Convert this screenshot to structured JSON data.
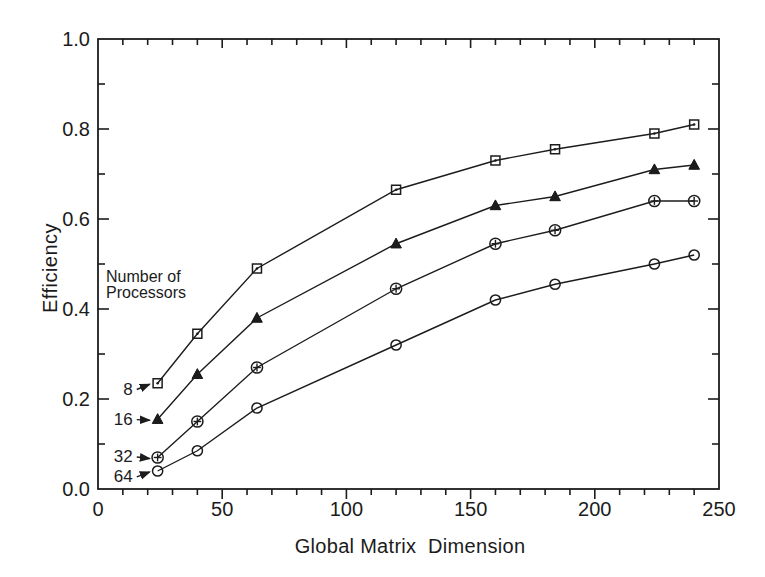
{
  "figure": {
    "y_axis_label": "Efficiency",
    "x_axis_label": "Global Matrix  Dimension",
    "legend_title_line1": "Number of",
    "legend_title_line2": "Processors"
  },
  "colors": {
    "ink": "#1c1c1c",
    "text": "#1b1b1b",
    "paper": "#ffffff"
  },
  "chart_data": {
    "type": "line",
    "title": "",
    "xlabel": "Global Matrix  Dimension",
    "ylabel": "Efficiency",
    "xlim": [
      0,
      250
    ],
    "ylim": [
      0.0,
      1.0
    ],
    "x_major_ticks": [
      0,
      50,
      100,
      150,
      200,
      250
    ],
    "x_minor_tick_step": 10,
    "y_major_ticks": [
      0.0,
      0.2,
      0.4,
      0.6,
      0.8,
      1.0
    ],
    "y_minor_tick_step": 0.1,
    "grid": false,
    "legend_position": "inside-left",
    "legend_title": [
      "Number of",
      "Processors"
    ],
    "x": [
      24,
      40,
      64,
      120,
      160,
      184,
      224,
      240
    ],
    "series": [
      {
        "name": "8",
        "processors": 8,
        "marker": "square-dot",
        "values": [
          0.235,
          0.345,
          0.49,
          0.665,
          0.73,
          0.755,
          0.79,
          0.81
        ]
      },
      {
        "name": "16",
        "processors": 16,
        "marker": "triangle-filled",
        "values": [
          0.155,
          0.255,
          0.38,
          0.545,
          0.63,
          0.65,
          0.71,
          0.72
        ]
      },
      {
        "name": "32",
        "processors": 32,
        "marker": "circle-plus",
        "values": [
          0.07,
          0.15,
          0.27,
          0.445,
          0.545,
          0.575,
          0.64,
          0.64
        ]
      },
      {
        "name": "64",
        "processors": 64,
        "marker": "circle-open",
        "values": [
          0.04,
          0.085,
          0.18,
          0.32,
          0.42,
          0.455,
          0.5,
          0.52
        ]
      }
    ],
    "annotations": [
      {
        "label": "8",
        "series": "8",
        "at": [
          14,
          0.21
        ]
      },
      {
        "label": "16",
        "series": "16",
        "at": [
          14,
          0.143
        ]
      },
      {
        "label": "32",
        "series": "32",
        "at": [
          14,
          0.06
        ]
      },
      {
        "label": "64",
        "series": "64",
        "at": [
          14,
          0.016
        ]
      }
    ]
  }
}
